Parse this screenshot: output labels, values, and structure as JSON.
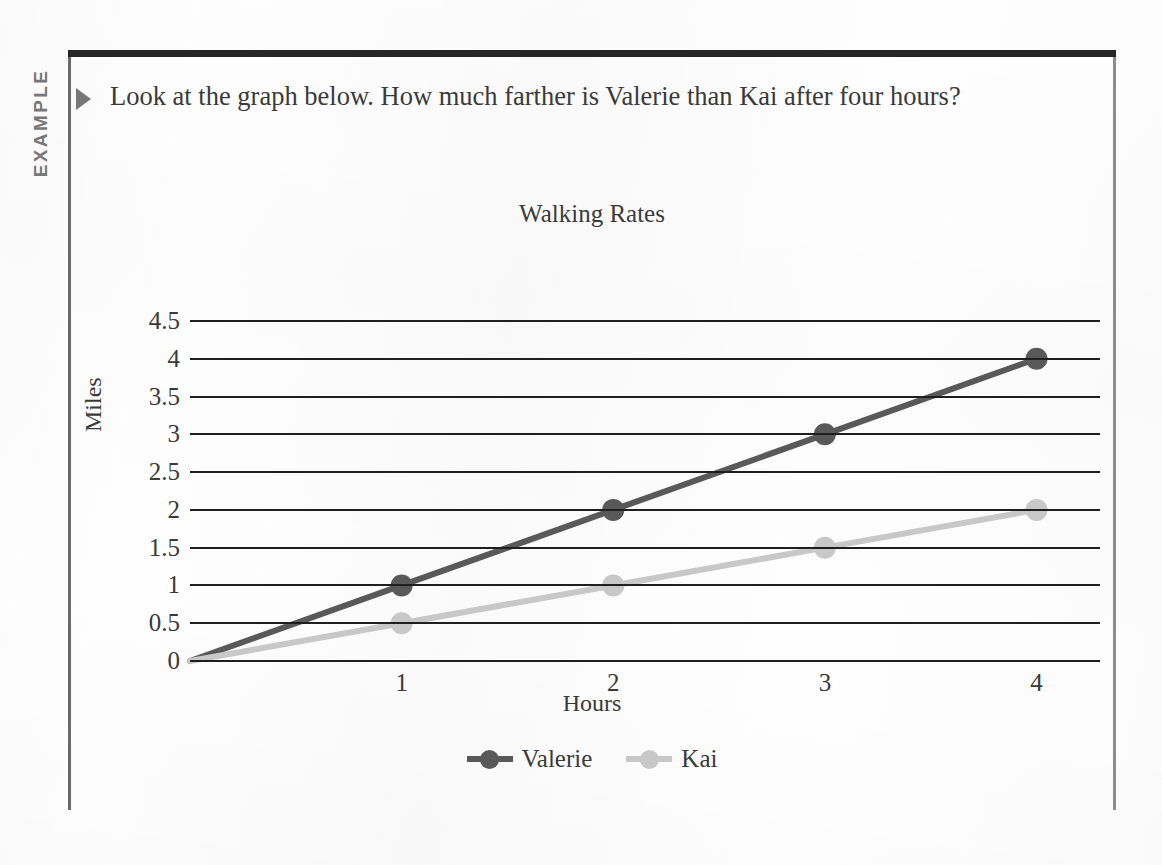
{
  "example_label": "EXAMPLE",
  "prompt": {
    "bullet_icon": "triangle-right-icon",
    "text": "Look at the graph below. How much farther is Valerie than Kai after four hours?"
  },
  "colors": {
    "valerie": "#595959",
    "kai": "#c8c8c8",
    "axis": "#1f1f1f",
    "text": "#3a3a3a",
    "example_tab": "#777777",
    "frame_top": "#262626"
  },
  "chart_data": {
    "type": "line",
    "title": "Walking Rates",
    "xlabel": "Hours",
    "ylabel": "Miles",
    "x": [
      0,
      1,
      2,
      3,
      4
    ],
    "xticks": [
      "1",
      "2",
      "3",
      "4"
    ],
    "xtick_values": [
      1,
      2,
      3,
      4
    ],
    "yticks": [
      "0",
      "0.5",
      "1",
      "1.5",
      "2",
      "2.5",
      "3",
      "3.5",
      "4",
      "4.5"
    ],
    "ytick_values": [
      0,
      0.5,
      1,
      1.5,
      2,
      2.5,
      3,
      3.5,
      4,
      4.5
    ],
    "xlim": [
      0,
      4.3
    ],
    "ylim": [
      0,
      4.5
    ],
    "grid": "horizontal",
    "legend_position": "bottom",
    "markers": true,
    "series": [
      {
        "name": "Valerie",
        "color": "#595959",
        "values": [
          0,
          1,
          2,
          3,
          4
        ]
      },
      {
        "name": "Kai",
        "color": "#c8c8c8",
        "values": [
          0,
          0.5,
          1,
          1.5,
          2
        ]
      }
    ]
  }
}
